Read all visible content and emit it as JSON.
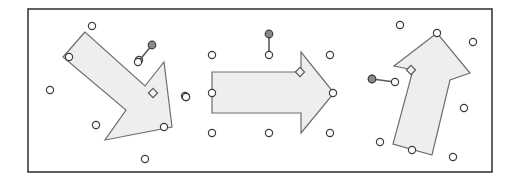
{
  "document": {
    "title": "Arrow Shapes Selection Canvas",
    "width": 521,
    "height": 188,
    "background_color": "#ffffff"
  },
  "frame": {
    "name": "canvas-border",
    "x": 28,
    "y": 9,
    "width": 464,
    "height": 163,
    "stroke_color": "#3a3a3a",
    "stroke_width": 1.6,
    "fill_color": "#ffffff"
  },
  "style": {
    "shape_fill": "#eeeeee",
    "shape_stroke": "#6e6e6e",
    "shape_stroke_width": 1.2,
    "handle_fill": "#ffffff",
    "handle_stroke": "#3c3c3c",
    "handle_radius": 3.6,
    "handle_stroke_width": 1.2,
    "rotation_knob_fill": "#8a8a8a",
    "rotation_knob_stroke": "#3c3c3c",
    "rotation_knob_radius": 3.8,
    "rotation_line_stroke": "#5a5a5a",
    "rotation_line_width": 1.6,
    "adjust_handle_fill": "#f2f2f2",
    "adjust_handle_stroke": "#5a5a5a",
    "adjust_handle_size": 4.6
  },
  "shapes": [
    {
      "name": "arrow-down-right",
      "label": "Rotated block arrow pointing down-right",
      "rotation_degrees": 135,
      "points": "85,32 69,55 121,100 101,127 171,127 164,62 147,83",
      "path": "M 85 32 L 63 57 L 126 110 L 105 140 L 172 127 L 164 62 L 145 86 Z",
      "vertex_handles": [
        {
          "name": "vertex-handle-tail-top",
          "x": 69,
          "y": 57
        },
        {
          "name": "vertex-handle-head-right",
          "x": 164,
          "y": 127
        }
      ],
      "adjust_handles": [
        {
          "name": "adjust-handle-head-notch",
          "x": 153,
          "y": 93
        }
      ],
      "rotation_handle": {
        "name": "rotation-handle",
        "knob": {
          "x": 152,
          "y": 45
        },
        "anchor": {
          "x": 138,
          "y": 62
        }
      },
      "bbox_handles": [
        {
          "name": "bbox-handle-n",
          "x": 92,
          "y": 26
        },
        {
          "name": "bbox-handle-w",
          "x": 50,
          "y": 90
        },
        {
          "name": "bbox-handle-sw",
          "x": 96,
          "y": 125
        },
        {
          "name": "bbox-handle-s",
          "x": 145,
          "y": 159
        },
        {
          "name": "bbox-handle-e",
          "x": 186,
          "y": 97
        },
        {
          "name": "bbox-handle-ne",
          "x": 139,
          "y": 60
        }
      ]
    },
    {
      "name": "arrow-right",
      "label": "Block arrow pointing right",
      "rotation_degrees": 0,
      "points": "212,72 301,72 301,52 332,93 301,132 301,112 212,112",
      "path": "M 212 72 L 301 72 L 301 52 L 334 93 L 301 133 L 301 113 L 212 113 Z",
      "vertex_handles": [
        {
          "name": "vertex-handle-tail-left",
          "x": 212,
          "y": 93
        },
        {
          "name": "vertex-handle-tip",
          "x": 333,
          "y": 93
        }
      ],
      "adjust_handles": [
        {
          "name": "adjust-handle-head-notch",
          "x": 300,
          "y": 72
        }
      ],
      "rotation_handle": {
        "name": "rotation-handle",
        "knob": {
          "x": 269,
          "y": 34
        },
        "anchor": {
          "x": 269,
          "y": 55
        }
      },
      "bbox_handles": [
        {
          "name": "bbox-handle-nw",
          "x": 212,
          "y": 55
        },
        {
          "name": "bbox-handle-ne",
          "x": 330,
          "y": 55
        },
        {
          "name": "bbox-handle-w",
          "x": 185,
          "y": 96
        },
        {
          "name": "bbox-handle-sw",
          "x": 212,
          "y": 133
        },
        {
          "name": "bbox-handle-s",
          "x": 269,
          "y": 133
        },
        {
          "name": "bbox-handle-se",
          "x": 330,
          "y": 133
        }
      ]
    },
    {
      "name": "arrow-up",
      "label": "Rotated block arrow pointing up",
      "rotation_degrees": -12,
      "points": "437,32 395,66 410,70 392,145 432,155 449,80 469,72",
      "path": "M 437 33 L 394 66 L 413 70 L 393 144 L 432 155 L 450 80 L 470 73 Z",
      "vertex_handles": [
        {
          "name": "vertex-handle-tip",
          "x": 437,
          "y": 33
        },
        {
          "name": "vertex-handle-tail",
          "x": 412,
          "y": 150
        }
      ],
      "adjust_handles": [
        {
          "name": "adjust-handle-head-notch",
          "x": 411,
          "y": 70
        }
      ],
      "rotation_handle": {
        "name": "rotation-handle",
        "knob": {
          "x": 372,
          "y": 79
        },
        "anchor": {
          "x": 395,
          "y": 82
        }
      },
      "bbox_handles": [
        {
          "name": "bbox-handle-nw",
          "x": 400,
          "y": 25
        },
        {
          "name": "bbox-handle-ne",
          "x": 473,
          "y": 42
        },
        {
          "name": "bbox-handle-e",
          "x": 464,
          "y": 108
        },
        {
          "name": "bbox-handle-se",
          "x": 453,
          "y": 157
        },
        {
          "name": "bbox-handle-sw",
          "x": 380,
          "y": 142
        },
        {
          "name": "bbox-handle-w",
          "x": 372,
          "y": 79
        }
      ]
    }
  ],
  "loose_handles": [
    {
      "name": "bbox-handle-left-outer",
      "x": 186,
      "y": 97
    }
  ]
}
